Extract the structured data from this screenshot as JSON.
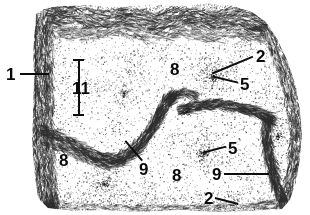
{
  "figure": {
    "background_color": "#ffffff",
    "ink_color": "#2d2d2d",
    "label_color": "#0a0a0a",
    "width": 310,
    "height": 215
  },
  "reference_labels": [
    {
      "id": "label-1",
      "text": "1",
      "x": 6,
      "y": 66,
      "size": 17
    },
    {
      "id": "label-2-top",
      "text": "2",
      "x": 256,
      "y": 48,
      "size": 17
    },
    {
      "id": "label-5-top",
      "text": "5",
      "x": 240,
      "y": 76,
      "size": 17
    },
    {
      "id": "label-8-top",
      "text": "8",
      "x": 170,
      "y": 61,
      "size": 17
    },
    {
      "id": "label-11",
      "text": "11",
      "x": 72,
      "y": 80,
      "size": 17
    },
    {
      "id": "label-8-left",
      "text": "8",
      "x": 59,
      "y": 152,
      "size": 17
    },
    {
      "id": "label-9-center",
      "text": "9",
      "x": 139,
      "y": 161,
      "size": 17
    },
    {
      "id": "label-8-bottom",
      "text": "8",
      "x": 172,
      "y": 167,
      "size": 17
    },
    {
      "id": "label-5-right",
      "text": "5",
      "x": 228,
      "y": 140,
      "size": 17
    },
    {
      "id": "label-9-right",
      "text": "9",
      "x": 212,
      "y": 166,
      "size": 17
    },
    {
      "id": "label-2-bottom",
      "text": "2",
      "x": 204,
      "y": 190,
      "size": 17
    }
  ],
  "leader_lines": [
    {
      "id": "leader-1",
      "x1": 20,
      "y1": 73,
      "x2": 49,
      "y2": 73
    },
    {
      "id": "leader-2-top",
      "x1": 253,
      "y1": 56,
      "x2": 212,
      "y2": 73
    },
    {
      "id": "leader-5-top",
      "x1": 238,
      "y1": 82,
      "x2": 213,
      "y2": 76
    },
    {
      "id": "leader-9-center",
      "x1": 142,
      "y1": 160,
      "x2": 125,
      "y2": 140
    },
    {
      "id": "leader-5-right",
      "x1": 226,
      "y1": 146,
      "x2": 203,
      "y2": 152
    },
    {
      "id": "leader-9-right",
      "x1": 224,
      "y1": 173,
      "x2": 269,
      "y2": 173
    },
    {
      "id": "leader-2-bottom",
      "x1": 215,
      "y1": 197,
      "x2": 238,
      "y2": 203
    }
  ],
  "scale_indicator": {
    "id": "extent-bar-11",
    "label": "11",
    "x": 78,
    "y_top": 59,
    "y_bottom": 114,
    "cap_width": 11
  },
  "structures": {
    "capsule_left_label": "1",
    "cortex_label": "8",
    "follicle_label": "2",
    "germinal_center_label": "5",
    "trabecula_label": "9",
    "thickness_label": "11"
  }
}
